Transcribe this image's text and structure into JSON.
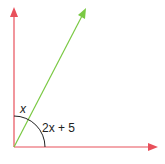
{
  "diagram": {
    "type": "angle-diagram",
    "colors": {
      "axis": "#e8505b",
      "ray": "#7ac943",
      "arc": "#222222",
      "text": "#222222"
    },
    "labels": {
      "upper_angle": "x",
      "lower_angle": "2x + 5"
    }
  }
}
